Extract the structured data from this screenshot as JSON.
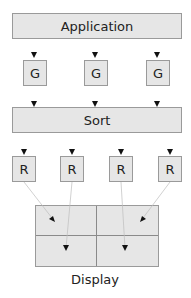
{
  "top": {
    "label": "Application"
  },
  "geometry_stage": {
    "units": [
      {
        "label": "G"
      },
      {
        "label": "G"
      },
      {
        "label": "G"
      }
    ]
  },
  "sort": {
    "label": "Sort"
  },
  "raster_stage": {
    "units": [
      {
        "label": "R"
      },
      {
        "label": "R"
      },
      {
        "label": "R"
      },
      {
        "label": "R"
      }
    ]
  },
  "display": {
    "label": "Display",
    "tiles": 4
  },
  "colors": {
    "box_fill": "#e6e6e6",
    "box_border": "#9a9a9a",
    "arrow": "#111111"
  }
}
